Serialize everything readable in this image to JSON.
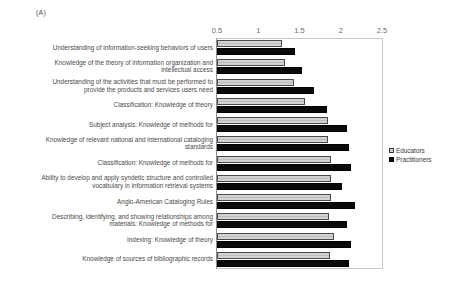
{
  "panel": {
    "tag": "(A)"
  },
  "legend": {
    "position": "right-middle",
    "entries": [
      {
        "label": "Educators",
        "color": "#c6c6c6",
        "swatch": "educators"
      },
      {
        "label": "Practitioners",
        "color": "#0a0a0a",
        "swatch": "practitioners"
      }
    ]
  },
  "chart_data": {
    "type": "bar",
    "orientation": "horizontal",
    "title": "",
    "subtitle": "",
    "xlabel": "",
    "ylabel": "",
    "xlim": [
      0.5,
      2.5
    ],
    "xticks": [
      0.5,
      1,
      1.5,
      2,
      2.5
    ],
    "xtick_labels": [
      "0.5",
      "1",
      "1.5",
      "2",
      "2.5"
    ],
    "grid": false,
    "axis_position": "top",
    "categories": [
      "Understanding of information-seeking behaviors of users",
      "Knowledge of the theory of information organization and intellectual access",
      "Understanding of the activities that must be performed to provide the products and services users need",
      "Classification: Knowledge of theory",
      "Subject analysis: Knowledge of methods for",
      "Knowledge of relevant national and international cataloging standards",
      "Classification: Knowledge of methods for",
      "Ability to develop and apply syndetic structure and controlled vocabulary in information retrieval systems",
      "Anglo-American Cataloging Rules",
      "Describing, identifying, and showing relationships among materials: Knowledge of methods for",
      "Indexing: Knowledge of theory",
      "Knowledge of sources of bibliographic records"
    ],
    "series": [
      {
        "name": "Educators",
        "values": [
          1.29,
          1.33,
          1.43,
          1.57,
          1.85,
          1.84,
          1.88,
          1.88,
          1.88,
          1.86,
          1.92,
          1.87
        ]
      },
      {
        "name": "Practitioners",
        "values": [
          1.45,
          1.53,
          1.68,
          1.83,
          2.08,
          2.1,
          2.13,
          2.02,
          2.17,
          2.08,
          2.13,
          2.1
        ]
      }
    ]
  }
}
